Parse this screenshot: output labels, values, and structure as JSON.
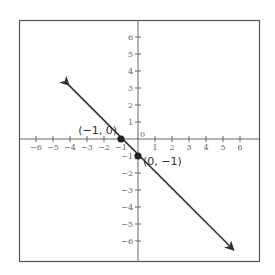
{
  "chart_data": {
    "type": "line",
    "title": "",
    "xlabel": "",
    "ylabel": "",
    "xlim": [
      -7,
      7
    ],
    "ylim": [
      -7,
      7
    ],
    "grid": false,
    "x_ticks": [
      -6,
      -5,
      -4,
      -3,
      -2,
      -1,
      0,
      1,
      2,
      3,
      4,
      5,
      6
    ],
    "y_ticks": [
      6,
      5,
      4,
      3,
      2,
      1,
      0,
      -1,
      -2,
      -3,
      -4,
      -5,
      -6
    ],
    "tick_labels": {
      "x": [
        "−6",
        "−5",
        "−4",
        "−3",
        "−2",
        "−1",
        "0",
        "1",
        "2",
        "3",
        "4",
        "5",
        "6"
      ],
      "y": [
        "6",
        "5",
        "4",
        "3",
        "2",
        "1",
        "0",
        "−1",
        "−2",
        "−3",
        "−4",
        "−5",
        "−6"
      ]
    },
    "series": [
      {
        "name": "y = -x - 1",
        "equation": "y = -x - 1",
        "x": [
          -4.1,
          5.6
        ],
        "y": [
          3.2,
          -6.5
        ],
        "arrows": "both",
        "color": "#333333"
      }
    ],
    "points": [
      {
        "x": -1,
        "y": 0,
        "label": "(−1, 0)"
      },
      {
        "x": 0,
        "y": -1,
        "label": "(0, −1)"
      }
    ]
  },
  "colors": {
    "frame": "#555555",
    "axis": "#666666",
    "line": "#333333",
    "point": "#222222"
  }
}
